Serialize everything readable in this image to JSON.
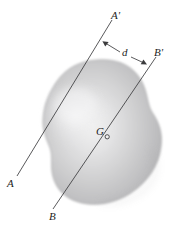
{
  "figure": {
    "background_color": "#ffffff",
    "body": {
      "name": "irregular-plane-area",
      "fill_light": "#ececed",
      "fill_mid": "#c9c9ca",
      "fill_dark": "#a9a9ab",
      "edge_color": "#9a9a9c"
    },
    "axes": [
      {
        "id": "axis-aa",
        "start_label": "A",
        "end_label": "A'",
        "color": "#3a3a3c",
        "start": {
          "x": 17,
          "y": 176
        },
        "end": {
          "x": 112,
          "y": 20
        }
      },
      {
        "id": "axis-bb",
        "start_label": "B",
        "end_label": "B'",
        "color": "#3a3a3c",
        "start": {
          "x": 53,
          "y": 209
        },
        "end": {
          "x": 156,
          "y": 57
        }
      }
    ],
    "centroid": {
      "label": "G",
      "marker": "open-circle",
      "x": 107,
      "y": 137,
      "color": "#1d1d1d"
    },
    "dimension": {
      "label": "d",
      "meaning": "perpendicular distance between axis A-A' and axis B-B'",
      "color": "#3a3a3c",
      "arrow_left_tip": {
        "x": 103,
        "y": 41
      },
      "arrow_right_tip": {
        "x": 146,
        "y": 64
      },
      "label_x": 123,
      "label_y": 48
    },
    "labels": {
      "a_prime": "A'",
      "b_prime": "B'",
      "a": "A",
      "b": "B",
      "d": "d",
      "g": "G"
    }
  }
}
